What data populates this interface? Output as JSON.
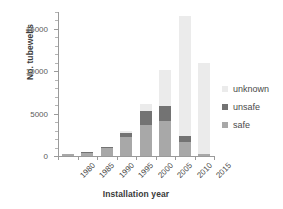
{
  "chart_data": {
    "type": "bar",
    "subtype": "stacked-vertical",
    "title": "",
    "xlabel": "Installation year",
    "ylabel": "No. tubewells",
    "categories": [
      "1980",
      "1985",
      "1990",
      "1995",
      "2000",
      "2005",
      "2010",
      "2015"
    ],
    "series": [
      {
        "name": "safe",
        "color": "#a8a8a8",
        "values": [
          180,
          380,
          950,
          2200,
          3700,
          4100,
          1700,
          200
        ]
      },
      {
        "name": "unsafe",
        "color": "#737373",
        "values": [
          20,
          40,
          80,
          550,
          1600,
          1800,
          700,
          30
        ]
      },
      {
        "name": "unknown",
        "color": "#ebebeb",
        "values": [
          0,
          0,
          0,
          180,
          900,
          4300,
          14100,
          10770
        ]
      }
    ],
    "totals": [
      200,
      420,
      1030,
      2930,
      6200,
      10200,
      16500,
      11000
    ],
    "stack_order_bottom_to_top": [
      "safe",
      "unsafe",
      "unknown"
    ],
    "ylim": [
      0,
      17000
    ],
    "yticks": [
      0,
      5000,
      10000,
      15000
    ],
    "ytick_labels": [
      "0",
      "5000",
      "10000",
      "15000"
    ],
    "yminor_tick_interval": 1000,
    "grid": false,
    "legend_position": "right",
    "legend_entries": [
      "unknown",
      "unsafe",
      "safe"
    ],
    "xtick_label_rotation_deg": -45
  },
  "legend": {
    "items": [
      {
        "label": "unknown",
        "color": "#ebebeb"
      },
      {
        "label": "unsafe",
        "color": "#737373"
      },
      {
        "label": "safe",
        "color": "#a8a8a8"
      }
    ]
  }
}
